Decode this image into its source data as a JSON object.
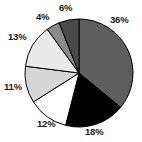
{
  "chart_data": {
    "type": "pie",
    "title": "",
    "subtitle": "",
    "xlabel": "",
    "ylabel": "",
    "legend_position": "none",
    "grid": false,
    "labels_shown_as": "percent",
    "start_angle_deg": 0,
    "direction": "clockwise",
    "categories": [
      "Slice 1",
      "Slice 2",
      "Slice 3",
      "Slice 4",
      "Slice 5",
      "Slice 6",
      "Slice 7"
    ],
    "values": [
      36,
      18,
      12,
      11,
      13,
      4,
      6
    ],
    "data_labels": [
      "36%",
      "18%",
      "12%",
      "11%",
      "13%",
      "4%",
      "6%"
    ],
    "colors": [
      "#5e5e5e",
      "#000000",
      "#ffffff",
      "#d6d6d6",
      "#e9e9e9",
      "#8a8a8a",
      "#4a4a4a"
    ],
    "slice_border_color": "#000000",
    "slices": [
      {
        "label": "36%",
        "value": 36,
        "color": "#5e5e5e",
        "label_x": 110,
        "label_y": 15
      },
      {
        "label": "18%",
        "value": 18,
        "color": "#000000",
        "label_x": 85,
        "label_y": 127
      },
      {
        "label": "12%",
        "value": 12,
        "color": "#ffffff",
        "label_x": 37,
        "label_y": 119
      },
      {
        "label": "11%",
        "value": 11,
        "color": "#d6d6d6",
        "label_x": 4,
        "label_y": 82
      },
      {
        "label": "13%",
        "value": 13,
        "color": "#e9e9e9",
        "label_x": 8,
        "label_y": 32
      },
      {
        "label": "4%",
        "value": 4,
        "color": "#8a8a8a",
        "label_x": 36,
        "label_y": 12
      },
      {
        "label": "6%",
        "value": 6,
        "color": "#4a4a4a",
        "label_x": 59,
        "label_y": 3
      }
    ],
    "geometry": {
      "center_x": 79,
      "center_y": 73,
      "radius": 54
    }
  }
}
